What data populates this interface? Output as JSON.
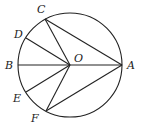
{
  "diagram": {
    "type": "geometry-circle",
    "circle": {
      "center": "O",
      "cx": 70,
      "cy": 65,
      "r": 52
    },
    "points": [
      {
        "name": "O",
        "x": 70,
        "y": 65,
        "label": "O",
        "lx": 74,
        "ly": 62
      },
      {
        "name": "A",
        "x": 122,
        "y": 65,
        "label": "A",
        "lx": 127,
        "ly": 69
      },
      {
        "name": "B",
        "x": 18,
        "y": 65,
        "label": "B",
        "lx": 5,
        "ly": 69
      },
      {
        "name": "C",
        "x": 45,
        "y": 19,
        "label": "C",
        "lx": 37,
        "ly": 13
      },
      {
        "name": "D",
        "x": 26,
        "y": 38,
        "label": "D",
        "lx": 14,
        "ly": 38
      },
      {
        "name": "E",
        "x": 26,
        "y": 92,
        "label": "E",
        "lx": 13,
        "ly": 102
      },
      {
        "name": "F",
        "x": 46,
        "y": 111,
        "label": "F",
        "lx": 31,
        "ly": 122
      }
    ],
    "segments": [
      [
        "B",
        "A"
      ],
      [
        "C",
        "O"
      ],
      [
        "C",
        "A"
      ],
      [
        "D",
        "O"
      ],
      [
        "E",
        "O"
      ],
      [
        "F",
        "O"
      ],
      [
        "F",
        "A"
      ]
    ]
  }
}
